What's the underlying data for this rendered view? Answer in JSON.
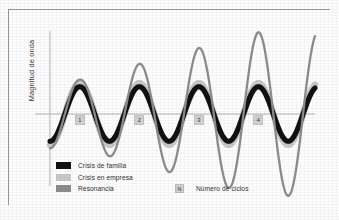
{
  "figure": {
    "y_axis_label": "Magnitud de onda",
    "cycle_markers": [
      "1",
      "2",
      "3",
      "4"
    ]
  },
  "legend": {
    "items": [
      {
        "label": "Crisis de familia",
        "color": "#111111"
      },
      {
        "label": "Crisis en empresa",
        "color": "#c9c9c9"
      },
      {
        "label": "Resonancia",
        "color": "#8d8d8d"
      }
    ]
  },
  "cycle_key": {
    "symbol": "N",
    "label": "Número de ciclos"
  },
  "colors": {
    "frame": "#9b9b9b",
    "axis": "#b4b4b4",
    "zero_line": "#b4b4b4",
    "background": "#fefefe",
    "marker_fill": "#d4d4d4"
  },
  "chart_data": {
    "type": "line",
    "title": "",
    "xlabel": "",
    "ylabel": "Magnitud de onda",
    "grid": false,
    "legend_position": "bottom-left",
    "x": [
      0,
      1,
      2,
      3,
      4
    ],
    "xlim": [
      0,
      4.45
    ],
    "ylim": [
      -1.95,
      1.95
    ],
    "xtick_labels": [
      "1",
      "2",
      "3",
      "4"
    ],
    "annotations": [
      "N = Número de ciclos"
    ],
    "series": [
      {
        "name": "Crisis de familia",
        "color": "#111111",
        "amplitude": [
          0.62,
          0.62,
          0.62,
          0.62
        ],
        "note": "Onda de amplitud constante; banda negra"
      },
      {
        "name": "Crisis en empresa",
        "color": "#c9c9c9",
        "amplitude": [
          0.7,
          0.7,
          0.7,
          0.7
        ],
        "note": "Onda de amplitud constante; banda gris clara, ligeramente mayor"
      },
      {
        "name": "Resonancia",
        "color": "#8d8d8d",
        "amplitude": [
          0.78,
          1.14,
          1.5,
          1.86
        ],
        "note": "Amplitud creciente ciclo a ciclo por resonancia"
      }
    ]
  }
}
